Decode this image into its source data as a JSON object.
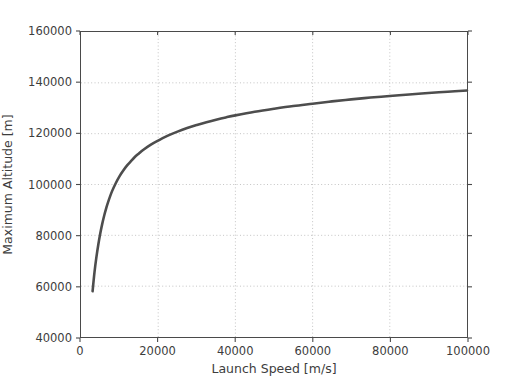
{
  "chart_data": {
    "type": "line",
    "title": "",
    "xlabel": "Launch Speed [m/s]",
    "ylabel": "Maximum Altitude [m]",
    "xlim": [
      0,
      100000
    ],
    "ylim": [
      40000,
      160000
    ],
    "xticks": [
      0,
      20000,
      40000,
      60000,
      80000,
      100000
    ],
    "yticks": [
      40000,
      60000,
      80000,
      100000,
      120000,
      140000,
      160000
    ],
    "xtick_labels": [
      "0",
      "20000",
      "40000",
      "60000",
      "80000",
      "100000"
    ],
    "ytick_labels": [
      "40000",
      "60000",
      "80000",
      "100000",
      "120000",
      "140000",
      "160000"
    ],
    "grid": true,
    "grid_style": "dotted",
    "legend": null,
    "legend_position": "none",
    "line_color": "#4d4d4d",
    "background_color": "#ffffff",
    "axes_color": "#4a4a4a",
    "series": [
      {
        "name": "Maximum Altitude",
        "x": [
          3000,
          3500,
          4000,
          4500,
          5000,
          5500,
          6000,
          6500,
          7000,
          8000,
          9000,
          10000,
          11000,
          12000,
          13000,
          14000,
          15000,
          16000,
          18000,
          20000,
          22500,
          25000,
          27500,
          30000,
          32500,
          35000,
          37500,
          40000,
          45000,
          50000,
          55000,
          60000,
          65000,
          70000,
          75000,
          80000,
          85000,
          90000,
          95000,
          100000
        ],
        "y": [
          58000,
          65500,
          71500,
          76500,
          80800,
          84500,
          87700,
          90500,
          93000,
          97200,
          100500,
          103300,
          105600,
          107600,
          109300,
          110900,
          112200,
          113500,
          115600,
          117300,
          119200,
          120800,
          122200,
          123400,
          124500,
          125500,
          126400,
          127200,
          128600,
          129800,
          130900,
          131800,
          132700,
          133500,
          134200,
          134800,
          135400,
          136000,
          136500,
          137000
        ]
      }
    ]
  },
  "axis": {
    "x_title": "Launch Speed [m/s]",
    "y_title": "Maximum Altitude [m]"
  }
}
